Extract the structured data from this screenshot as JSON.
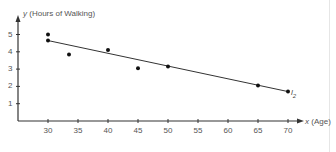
{
  "chart_data": {
    "type": "scatter",
    "title": "",
    "xlabel": "x (Age)",
    "ylabel": "y (Hours of Walking)",
    "x_ticks": [
      30,
      35,
      40,
      45,
      50,
      55,
      60,
      65,
      70
    ],
    "y_ticks": [
      1,
      2,
      3,
      4,
      5
    ],
    "xlim": [
      25,
      72
    ],
    "ylim": [
      0,
      5.5
    ],
    "grid": false,
    "series": [
      {
        "name": "data points",
        "type": "scatter",
        "points": [
          {
            "x": 30,
            "y": 5.0
          },
          {
            "x": 30,
            "y": 4.65
          },
          {
            "x": 33.5,
            "y": 3.85
          },
          {
            "x": 40,
            "y": 4.1
          },
          {
            "x": 45,
            "y": 3.05
          },
          {
            "x": 50,
            "y": 3.15
          },
          {
            "x": 65,
            "y": 2.05
          },
          {
            "x": 70,
            "y": 1.7
          }
        ]
      },
      {
        "name": "l2",
        "type": "line",
        "label": "l",
        "label_sub": "2",
        "points": [
          {
            "x": 30,
            "y": 4.65
          },
          {
            "x": 70,
            "y": 1.7
          }
        ]
      }
    ]
  },
  "labels": {
    "y_axis": "y (Hours of Walking)",
    "x_axis": "x (Age)",
    "line_name": "l",
    "line_sub": "2"
  },
  "colors": {
    "axis": "#333333",
    "points": "#111111",
    "line": "#333333",
    "text": "#555555"
  }
}
